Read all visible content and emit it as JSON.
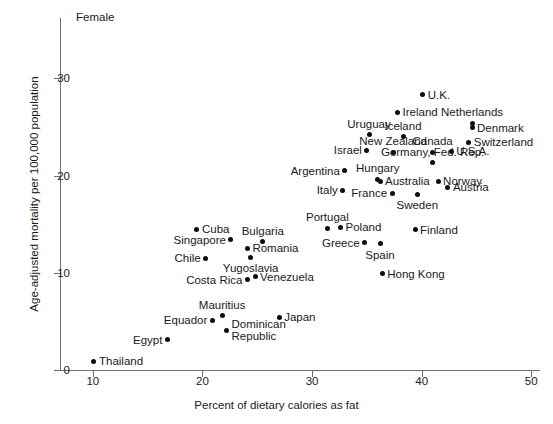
{
  "panel": {
    "title": "Female"
  },
  "axes": {
    "x": {
      "label": "Percent of dietary calories as fat",
      "ticks": [
        10,
        20,
        30,
        40,
        50
      ],
      "min": 7.0,
      "max": 50.8
    },
    "y": {
      "label": "Age-adjusted mortality per 100,000 population",
      "ticks": [
        0,
        10,
        20,
        30
      ],
      "min": 0,
      "max": 36.2
    }
  },
  "chart_data": {
    "type": "scatter",
    "title": "Female",
    "xlabel": "Percent of dietary calories as fat",
    "ylabel": "Age-adjusted mortality per 100,000 population",
    "xlim": [
      7.0,
      50.8
    ],
    "ylim": [
      0,
      36.2
    ],
    "xticks": [
      10,
      20,
      30,
      40,
      50
    ],
    "yticks": [
      0,
      10,
      20,
      30
    ],
    "grid": false,
    "legend": "none",
    "point_label_note": "each point is annotated with its country name",
    "points": [
      {
        "name": "Thailand",
        "x": 10.1,
        "y": 0.9,
        "anchor": "right"
      },
      {
        "name": "Egypt",
        "x": 16.8,
        "y": 3.1,
        "anchor": "left"
      },
      {
        "name": "Equador",
        "x": 20.9,
        "y": 5.1,
        "anchor": "left"
      },
      {
        "name": "Mauritius",
        "x": 21.8,
        "y": 5.6,
        "anchor": "above"
      },
      {
        "name": "Dominican\nRepublic",
        "x": 22.2,
        "y": 4.1,
        "anchor": "right"
      },
      {
        "name": "Japan",
        "x": 27.0,
        "y": 5.4,
        "anchor": "right"
      },
      {
        "name": "Costa Rica",
        "x": 24.1,
        "y": 9.3,
        "anchor": "left"
      },
      {
        "name": "Venezuela",
        "x": 24.8,
        "y": 9.6,
        "anchor": "right"
      },
      {
        "name": "Chile",
        "x": 20.3,
        "y": 11.5,
        "anchor": "left"
      },
      {
        "name": "Yugoslavia",
        "x": 24.4,
        "y": 11.6,
        "anchor": "below"
      },
      {
        "name": "Romania",
        "x": 24.1,
        "y": 12.5,
        "anchor": "right"
      },
      {
        "name": "Singapore",
        "x": 22.6,
        "y": 13.4,
        "anchor": "left"
      },
      {
        "name": "Bulgaria",
        "x": 25.5,
        "y": 13.2,
        "anchor": "above"
      },
      {
        "name": "Cuba",
        "x": 19.5,
        "y": 14.5,
        "anchor": "right"
      },
      {
        "name": "Portugal",
        "x": 31.4,
        "y": 14.6,
        "anchor": "above"
      },
      {
        "name": "Poland",
        "x": 32.6,
        "y": 14.7,
        "anchor": "right"
      },
      {
        "name": "Greece",
        "x": 34.8,
        "y": 13.1,
        "anchor": "left"
      },
      {
        "name": "Spain",
        "x": 36.2,
        "y": 13.0,
        "anchor": "below"
      },
      {
        "name": "Finland",
        "x": 39.4,
        "y": 14.4,
        "anchor": "right"
      },
      {
        "name": "Hong Kong",
        "x": 36.4,
        "y": 9.9,
        "anchor": "right"
      },
      {
        "name": "Italy",
        "x": 32.8,
        "y": 18.5,
        "anchor": "left"
      },
      {
        "name": "Argentina",
        "x": 33.0,
        "y": 20.5,
        "anchor": "left"
      },
      {
        "name": "Hungary",
        "x": 36.0,
        "y": 19.6,
        "anchor": "above"
      },
      {
        "name": "Australia",
        "x": 36.2,
        "y": 19.4,
        "anchor": "right"
      },
      {
        "name": "France",
        "x": 37.3,
        "y": 18.2,
        "anchor": "left"
      },
      {
        "name": "Sweden",
        "x": 39.6,
        "y": 18.1,
        "anchor": "below"
      },
      {
        "name": "Norway",
        "x": 41.5,
        "y": 19.4,
        "anchor": "right"
      },
      {
        "name": "Austria",
        "x": 42.4,
        "y": 18.8,
        "anchor": "right"
      },
      {
        "name": "Germany, Fed. Rep.",
        "x": 41.0,
        "y": 21.3,
        "anchor": "above"
      },
      {
        "name": "U.S.A.",
        "x": 42.7,
        "y": 22.5,
        "anchor": "right"
      },
      {
        "name": "Canada",
        "x": 41.0,
        "y": 22.4,
        "anchor": "above"
      },
      {
        "name": "Israel",
        "x": 35.0,
        "y": 22.6,
        "anchor": "left"
      },
      {
        "name": "New Zealand",
        "x": 37.4,
        "y": 22.4,
        "anchor": "above"
      },
      {
        "name": "Uruguay",
        "x": 35.2,
        "y": 24.2,
        "anchor": "above"
      },
      {
        "name": "Iceland",
        "x": 38.3,
        "y": 24.0,
        "anchor": "above"
      },
      {
        "name": "Switzerland",
        "x": 44.3,
        "y": 23.4,
        "anchor": "right"
      },
      {
        "name": "Denmark",
        "x": 44.6,
        "y": 24.9,
        "anchor": "right"
      },
      {
        "name": "Netherlands",
        "x": 44.6,
        "y": 25.4,
        "anchor": "above"
      },
      {
        "name": "Ireland",
        "x": 37.8,
        "y": 26.5,
        "anchor": "right"
      },
      {
        "name": "U.K.",
        "x": 40.1,
        "y": 28.3,
        "anchor": "right"
      }
    ]
  }
}
